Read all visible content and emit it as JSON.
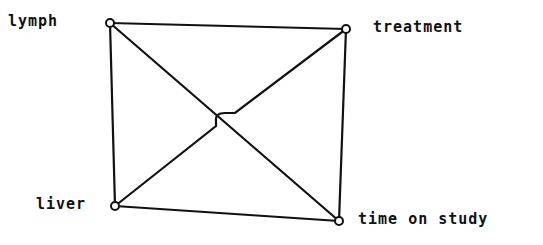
{
  "diagram": {
    "type": "undirected-graph",
    "nodes": [
      {
        "id": "lymph",
        "label": "lymph",
        "x": 110,
        "y": 23,
        "label_x": 8,
        "label_y": 26
      },
      {
        "id": "treatment",
        "label": "treatment",
        "x": 346,
        "y": 29,
        "label_x": 373,
        "label_y": 32
      },
      {
        "id": "liver",
        "label": "liver",
        "x": 115,
        "y": 206,
        "label_x": 36,
        "label_y": 209
      },
      {
        "id": "time_on_study",
        "label": "time on study",
        "x": 339,
        "y": 221,
        "label_x": 358,
        "label_y": 223
      }
    ],
    "edges": [
      [
        "lymph",
        "treatment"
      ],
      [
        "lymph",
        "liver"
      ],
      [
        "lymph",
        "time_on_study"
      ],
      [
        "treatment",
        "liver"
      ],
      [
        "treatment",
        "time_on_study"
      ],
      [
        "liver",
        "time_on_study"
      ]
    ],
    "crossing_note": "treatment–liver edge hops over lymph–time on study edge"
  },
  "labels": {
    "lymph": "lymph",
    "treatment": "treatment",
    "liver": "liver",
    "time_on_study": "time on study"
  }
}
